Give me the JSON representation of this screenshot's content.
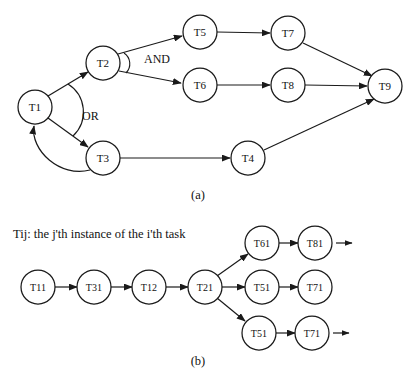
{
  "figure": {
    "panel_a": {
      "label": "(a)",
      "nodes": [
        {
          "id": "T1",
          "label": "T1",
          "cx": 35,
          "cy": 107,
          "r": 17
        },
        {
          "id": "T2",
          "label": "T2",
          "cx": 103,
          "cy": 63,
          "r": 17
        },
        {
          "id": "T3",
          "label": "T3",
          "cx": 103,
          "cy": 158,
          "r": 17
        },
        {
          "id": "T4",
          "label": "T4",
          "cx": 248,
          "cy": 158,
          "r": 17
        },
        {
          "id": "T5",
          "label": "T5",
          "cx": 200,
          "cy": 32,
          "r": 17
        },
        {
          "id": "T6",
          "label": "T6",
          "cx": 200,
          "cy": 85,
          "r": 17
        },
        {
          "id": "T7",
          "label": "T7",
          "cx": 288,
          "cy": 33,
          "r": 17
        },
        {
          "id": "T8",
          "label": "T8",
          "cx": 288,
          "cy": 85,
          "r": 17
        },
        {
          "id": "T9",
          "label": "T9",
          "cx": 385,
          "cy": 86,
          "r": 17
        }
      ],
      "edges": [
        {
          "from": "T1",
          "to": "T2"
        },
        {
          "from": "T1",
          "to": "T3"
        },
        {
          "from": "T2",
          "to": "T5"
        },
        {
          "from": "T2",
          "to": "T6"
        },
        {
          "from": "T3",
          "to": "T4"
        },
        {
          "from": "T5",
          "to": "T7"
        },
        {
          "from": "T6",
          "to": "T8"
        },
        {
          "from": "T7",
          "to": "T9"
        },
        {
          "from": "T8",
          "to": "T9"
        },
        {
          "from": "T4",
          "to": "T9"
        }
      ],
      "feedback_edges": [
        {
          "from": "T3",
          "to": "T1"
        }
      ],
      "operators": [
        {
          "id": "and-operator",
          "label": "AND",
          "at_node": "T2",
          "label_x": 144,
          "label_y": 59
        },
        {
          "id": "or-operator",
          "label": "OR",
          "at_node": "T1",
          "label_x": 82,
          "label_y": 116
        }
      ]
    },
    "panel_b": {
      "label": "(b)",
      "note": "Tij: the j'th instance of the i'th task",
      "nodes": [
        {
          "id": "T11",
          "label": "T11",
          "cx": 38,
          "cy": 287,
          "r": 17
        },
        {
          "id": "T31",
          "label": "T31",
          "cx": 94,
          "cy": 287,
          "r": 17
        },
        {
          "id": "T12",
          "label": "T12",
          "cx": 149,
          "cy": 287,
          "r": 17
        },
        {
          "id": "T21",
          "label": "T21",
          "cx": 205,
          "cy": 287,
          "r": 17
        },
        {
          "id": "T61",
          "label": "T61",
          "cx": 262,
          "cy": 243,
          "r": 17
        },
        {
          "id": "T81",
          "label": "T81",
          "cx": 315,
          "cy": 243,
          "r": 17
        },
        {
          "id": "T51a",
          "label": "T51",
          "cx": 262,
          "cy": 287,
          "r": 17
        },
        {
          "id": "T71a",
          "label": "T71",
          "cx": 315,
          "cy": 287,
          "r": 17
        },
        {
          "id": "T51b",
          "label": "T51",
          "cx": 259,
          "cy": 333,
          "r": 17
        },
        {
          "id": "T71b",
          "label": "T71",
          "cx": 312,
          "cy": 333,
          "r": 17
        }
      ],
      "edges": [
        {
          "from": "T11",
          "to": "T31"
        },
        {
          "from": "T31",
          "to": "T12"
        },
        {
          "from": "T12",
          "to": "T21"
        },
        {
          "from": "T21",
          "to": "T61"
        },
        {
          "from": "T21",
          "to": "T51a"
        },
        {
          "from": "T21",
          "to": "T51b"
        },
        {
          "from": "T61",
          "to": "T81"
        },
        {
          "from": "T51a",
          "to": "T71a"
        },
        {
          "from": "T51b",
          "to": "T71b"
        }
      ],
      "continuations": [
        {
          "id": "continuation-from-T81",
          "from": "T81",
          "x1": 336,
          "y1": 243,
          "x2": 352,
          "y2": 243
        },
        {
          "id": "continuation-from-T71b",
          "from": "T71b",
          "x1": 333,
          "y1": 333,
          "x2": 349,
          "y2": 333
        }
      ]
    },
    "colors": {
      "stroke": "#1a1a1a",
      "node_fill": "#ffffff",
      "text": "#111111",
      "background": "#ffffff"
    }
  }
}
